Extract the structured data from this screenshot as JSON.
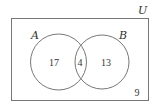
{
  "diagram": {
    "type": "venn",
    "universe_label": "U",
    "sets": [
      {
        "label": "A",
        "only_count": "17"
      },
      {
        "label": "B",
        "only_count": "13"
      }
    ],
    "intersection_count": "4",
    "outside_count": "9",
    "colors": {
      "stroke": "#777777",
      "text": "#333333",
      "background": "#ffffff"
    }
  }
}
